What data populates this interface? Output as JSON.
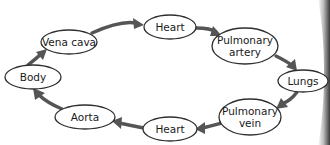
{
  "diagram": {
    "title": "",
    "nodes": [
      {
        "id": "vena-cava",
        "lines": [
          "Vena cava"
        ]
      },
      {
        "id": "heart-top",
        "lines": [
          "Heart"
        ]
      },
      {
        "id": "pulmonary-artery",
        "lines": [
          "Pulmonary",
          "artery"
        ]
      },
      {
        "id": "lungs",
        "lines": [
          "Lungs"
        ]
      },
      {
        "id": "pulmonary-vein",
        "lines": [
          "Pulmonary",
          "vein"
        ]
      },
      {
        "id": "heart-bottom",
        "lines": [
          "Heart"
        ]
      },
      {
        "id": "aorta",
        "lines": [
          "Aorta"
        ]
      },
      {
        "id": "body",
        "lines": [
          "Body"
        ]
      }
    ],
    "edges": [
      {
        "from": "vena-cava",
        "to": "heart-top"
      },
      {
        "from": "heart-top",
        "to": "pulmonary-artery"
      },
      {
        "from": "pulmonary-artery",
        "to": "lungs"
      },
      {
        "from": "lungs",
        "to": "pulmonary-vein"
      },
      {
        "from": "pulmonary-vein",
        "to": "heart-bottom"
      },
      {
        "from": "heart-bottom",
        "to": "aorta"
      },
      {
        "from": "aorta",
        "to": "body"
      },
      {
        "from": "body",
        "to": "vena-cava"
      }
    ],
    "colors": {
      "arrow": "#555555",
      "outline": "#2e2e2e",
      "text": "#1a1a1a"
    }
  }
}
